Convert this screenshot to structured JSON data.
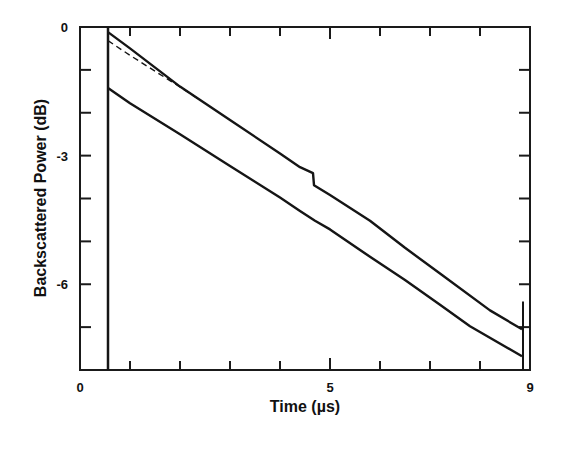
{
  "chart_data": {
    "type": "line",
    "title": "",
    "xlabel": "Time (µs)",
    "ylabel": "Backscattered Power (dB)",
    "xlim": [
      0,
      9
    ],
    "ylim": [
      -8,
      0
    ],
    "grid": false,
    "legend": null,
    "x_tick_labels": [
      {
        "value": 0,
        "label": "0"
      },
      {
        "value": 5,
        "label": "5"
      },
      {
        "value": 9,
        "label": "9"
      }
    ],
    "x_minor_ticks": [
      1,
      2,
      3,
      4,
      5,
      6,
      7,
      8
    ],
    "y_tick_labels": [
      {
        "value": 0,
        "label": "0"
      },
      {
        "value": -3,
        "label": "-3"
      },
      {
        "value": -6,
        "label": "-6"
      }
    ],
    "y_minor_ticks": [
      -1,
      -2,
      -3,
      -4,
      -5,
      -6,
      -7
    ],
    "series": [
      {
        "name": "upper trace",
        "style": "solid",
        "x": [
          0.56,
          1.0,
          2.0,
          3.0,
          4.0,
          4.4,
          4.66,
          4.68,
          5.0,
          5.8,
          6.5,
          7.2,
          8.2,
          8.84
        ],
        "y": [
          -0.12,
          -0.5,
          -1.39,
          -2.17,
          -2.95,
          -3.27,
          -3.41,
          -3.69,
          -3.92,
          -4.52,
          -5.15,
          -5.75,
          -6.61,
          -7.05
        ]
      },
      {
        "name": "fitted line",
        "style": "dashed",
        "x": [
          0.56,
          1.0,
          2.0,
          2.4
        ],
        "y": [
          -0.32,
          -0.66,
          -1.4,
          -1.7
        ]
      },
      {
        "name": "lower trace",
        "style": "solid",
        "x": [
          0.56,
          1.0,
          2.0,
          3.0,
          4.0,
          4.4,
          4.7,
          5.0,
          5.8,
          6.5,
          7.2,
          7.8,
          8.84
        ],
        "y": [
          -1.42,
          -1.78,
          -2.5,
          -3.24,
          -3.98,
          -4.29,
          -4.52,
          -4.72,
          -5.36,
          -5.9,
          -6.48,
          -6.98,
          -7.68
        ]
      }
    ],
    "annotations": [
      {
        "type": "vertical-line",
        "x": 0.56,
        "y_range": [
          -8,
          0
        ],
        "note": "launch pulse edge"
      },
      {
        "type": "vertical-spike",
        "x": 8.86,
        "y_range": [
          -8,
          -6.4
        ],
        "note": "end reflection"
      }
    ]
  }
}
